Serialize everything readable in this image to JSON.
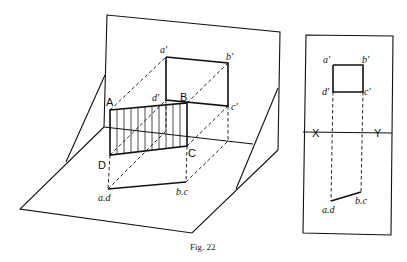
{
  "figure": {
    "caption": "Fig. 22",
    "pictorial_view": {
      "object_corner_labels": [
        "A",
        "B",
        "C",
        "D"
      ],
      "vertical_projection_labels": [
        "a'",
        "b'",
        "c'",
        "d'"
      ],
      "horizontal_projection_labels": [
        "a.d",
        "b.c"
      ],
      "description": "Rectangular lamina ABCD (hatched) perpendicular to HP, projected onto vertical and horizontal planes"
    },
    "orthographic_view": {
      "front_view_labels": [
        "a'",
        "b'",
        "c'",
        "d'"
      ],
      "reference_line_labels": [
        "X",
        "Y"
      ],
      "top_view_labels": [
        "a.d",
        "b.c"
      ]
    }
  }
}
